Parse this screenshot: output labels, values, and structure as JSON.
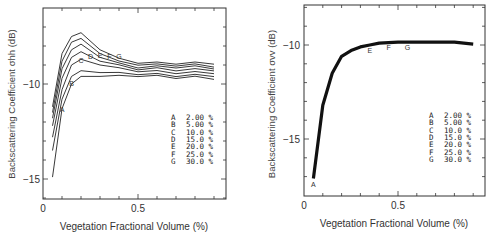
{
  "chart_data": [
    {
      "type": "line",
      "xlabel": "Vegetation Fractional Volume (%)",
      "ylabel": "Backscattering Coefficient σhh (dB)",
      "xticks": [
        "0",
        "0.5"
      ],
      "yticks": [
        "-10",
        "-15"
      ],
      "xlim": [
        0,
        0.95
      ],
      "ylim": [
        -16,
        -6.7
      ],
      "legend": [
        {
          "key": "A",
          "value": "2.00 %"
        },
        {
          "key": "B",
          "value": "5.00 %"
        },
        {
          "key": "C",
          "value": "10.0 %"
        },
        {
          "key": "D",
          "value": "15.0 %"
        },
        {
          "key": "E",
          "value": "20.0 %"
        },
        {
          "key": "F",
          "value": "25.0 %"
        },
        {
          "key": "G",
          "value": "30.0 %"
        }
      ],
      "x": [
        0.05,
        0.1,
        0.15,
        0.2,
        0.3,
        0.4,
        0.5,
        0.6,
        0.7,
        0.8,
        0.9
      ],
      "series": [
        {
          "name": "A",
          "values": [
            -14.9,
            -11.3,
            -10.0,
            -9.6,
            -9.6,
            -9.6,
            -9.55,
            -9.6,
            -9.65,
            -9.65,
            -9.7
          ]
        },
        {
          "name": "B",
          "values": [
            -13.5,
            -10.8,
            -9.6,
            -9.3,
            -9.4,
            -9.45,
            -9.45,
            -9.5,
            -9.55,
            -9.55,
            -9.55
          ]
        },
        {
          "name": "C",
          "values": [
            -12.8,
            -10.3,
            -9.0,
            -8.7,
            -9.0,
            -9.2,
            -9.3,
            -9.35,
            -9.4,
            -9.4,
            -9.4
          ]
        },
        {
          "name": "D",
          "values": [
            -12.2,
            -9.7,
            -8.6,
            -8.3,
            -8.8,
            -9.05,
            -9.2,
            -9.2,
            -9.25,
            -9.25,
            -9.25
          ]
        },
        {
          "name": "E",
          "values": [
            -11.8,
            -9.2,
            -8.2,
            -7.9,
            -8.6,
            -8.95,
            -9.1,
            -9.1,
            -9.1,
            -9.1,
            -9.15
          ]
        },
        {
          "name": "F",
          "values": [
            -11.5,
            -8.8,
            -7.8,
            -7.6,
            -8.4,
            -8.85,
            -8.95,
            -9.0,
            -9.0,
            -9.0,
            -9.05
          ]
        },
        {
          "name": "G",
          "values": [
            -11.2,
            -8.4,
            -7.5,
            -7.3,
            -8.2,
            -8.7,
            -8.85,
            -8.9,
            -8.9,
            -8.9,
            -8.9
          ]
        }
      ],
      "grid": false,
      "legend_position": "lower right"
    },
    {
      "type": "line",
      "xlabel": "Vegetation Fractional Volume (%)",
      "ylabel": "Backscattering Coefficient σvv (dB)",
      "xticks": [
        "0",
        "0.5"
      ],
      "yticks": [
        "-10",
        "-15"
      ],
      "xlim": [
        0,
        0.95
      ],
      "ylim": [
        -18,
        -8.2
      ],
      "legend": [
        {
          "key": "A",
          "value": "2.00 %"
        },
        {
          "key": "B",
          "value": "5.00 %"
        },
        {
          "key": "C",
          "value": "10.0 %"
        },
        {
          "key": "D",
          "value": "15.0 %"
        },
        {
          "key": "E",
          "value": "20.0 %"
        },
        {
          "key": "F",
          "value": "25.0 %"
        },
        {
          "key": "G",
          "value": "30.0 %"
        }
      ],
      "x": [
        0.05,
        0.1,
        0.15,
        0.2,
        0.25,
        0.3,
        0.35,
        0.4,
        0.5,
        0.6,
        0.7,
        0.8,
        0.9
      ],
      "series": [
        {
          "name": "A–G (overlapping)",
          "values": [
            -17.1,
            -13.2,
            -11.5,
            -10.6,
            -10.3,
            -10.1,
            -10.0,
            -9.9,
            -9.85,
            -9.85,
            -9.85,
            -9.85,
            -9.95
          ]
        }
      ],
      "grid": false,
      "legend_position": "lower right"
    }
  ]
}
